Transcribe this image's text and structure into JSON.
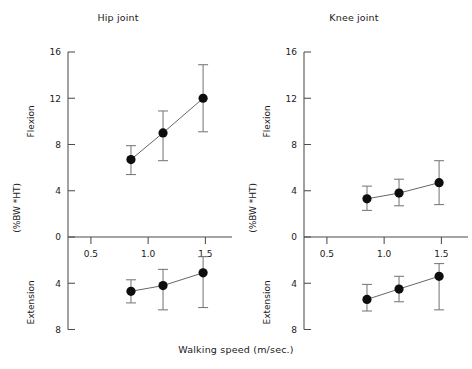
{
  "figure": {
    "xaxis_caption": "Walking speed (m/sec.)"
  },
  "chart_data": [
    {
      "type": "line",
      "title": "Hip joint",
      "xlabel": "Walking speed (m/sec.)",
      "ylabel": "(%BW *HT)",
      "upper_region_label": "Flexion",
      "lower_region_label": "Extension",
      "grid": false,
      "legend": "none",
      "x": [
        0.85,
        1.13,
        1.48
      ],
      "xlim": [
        0.3,
        1.68
      ],
      "xticks": [
        0.5,
        1.0,
        1.5
      ],
      "xtick_labels": [
        "0.5",
        "1.0",
        "1.5"
      ],
      "ylim": [
        -8,
        16
      ],
      "yticks": [
        16,
        12,
        8,
        4,
        0,
        -4,
        -8
      ],
      "ytick_labels": [
        "16",
        "12",
        "8",
        "4",
        "0",
        "4",
        "8"
      ],
      "series": [
        {
          "name": "Flexion",
          "values": [
            6.7,
            9.0,
            12.0
          ],
          "err_low": [
            1.3,
            2.4,
            2.9
          ],
          "err_high": [
            1.2,
            1.9,
            2.9
          ]
        },
        {
          "name": "Extension",
          "values": [
            -4.7,
            -4.2,
            -3.1
          ],
          "err_low": [
            1.0,
            2.1,
            3.0
          ],
          "err_high": [
            1.0,
            1.4,
            1.4
          ]
        }
      ]
    },
    {
      "type": "line",
      "title": "Knee joint",
      "xlabel": "Walking speed (m/sec.)",
      "ylabel": "(%BW *HT)",
      "upper_region_label": "Flexion",
      "lower_region_label": "Extension",
      "grid": false,
      "legend": "none",
      "x": [
        0.85,
        1.13,
        1.48
      ],
      "xlim": [
        0.3,
        1.68
      ],
      "xticks": [
        0.5,
        1.0,
        1.5
      ],
      "xtick_labels": [
        "0.5",
        "1.0",
        "1.5"
      ],
      "ylim": [
        -8,
        16
      ],
      "yticks": [
        16,
        12,
        8,
        4,
        0,
        -4,
        -8
      ],
      "ytick_labels": [
        "16",
        "12",
        "8",
        "4",
        "0",
        "4",
        "8"
      ],
      "series": [
        {
          "name": "Flexion",
          "values": [
            3.3,
            3.8,
            4.7
          ],
          "err_low": [
            1.0,
            1.1,
            1.9
          ],
          "err_high": [
            1.1,
            1.2,
            1.9
          ]
        },
        {
          "name": "Extension",
          "values": [
            -5.4,
            -4.5,
            -3.4
          ],
          "err_low": [
            1.0,
            1.1,
            2.9
          ],
          "err_high": [
            1.3,
            1.1,
            1.1
          ]
        }
      ]
    }
  ]
}
